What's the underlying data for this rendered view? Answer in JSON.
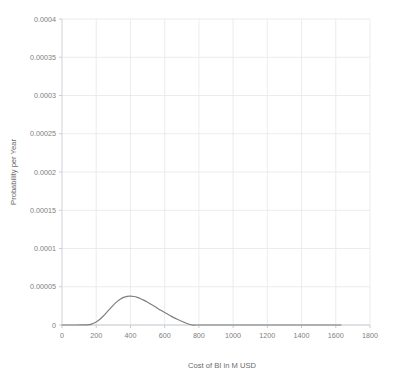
{
  "chart_data": {
    "type": "line",
    "title": "",
    "xlabel": "Cost of BI in M USD",
    "ylabel": "Probability per Year",
    "xlim": [
      0,
      1800
    ],
    "ylim": [
      0,
      0.0004
    ],
    "grid": true,
    "legend": false,
    "legend_position": "none",
    "line_color": "#7f7f7f",
    "xticks": [
      0,
      200,
      400,
      600,
      800,
      1000,
      1200,
      1400,
      1600,
      1800
    ],
    "xtick_labels": [
      "0",
      "200",
      "400",
      "600",
      "800",
      "1000",
      "1200",
      "1400",
      "1600",
      "1800"
    ],
    "yticks": [
      0,
      5e-05,
      0.0001,
      0.00015,
      0.0002,
      0.00025,
      0.0003,
      0.00035,
      0.0004
    ],
    "ytick_labels": [
      "0",
      "0.00005",
      "0.0001",
      "0.00015",
      "0.0002",
      "0.00025",
      "0.0003",
      "0.00035",
      "0.0004"
    ],
    "peak_x": 690,
    "peak_y": 3.77e-05,
    "series": [
      {
        "name": "Probability density of BI cost",
        "x": [
          0,
          40,
          80,
          120,
          160,
          180,
          200,
          220,
          240,
          260,
          280,
          300,
          320,
          340,
          360,
          380,
          400,
          420,
          440,
          460,
          480,
          500,
          520,
          540,
          560,
          580,
          600,
          620,
          640,
          660,
          680,
          700,
          720,
          740,
          760,
          780,
          800,
          820,
          840,
          860,
          880,
          900,
          920,
          940,
          960,
          980,
          1000,
          1040,
          1080,
          1120,
          1160,
          1200,
          1240,
          1280,
          1320,
          1360,
          1400,
          1440,
          1480,
          1520,
          1560,
          1600,
          1630
        ],
        "y": [
          0.0,
          0.0,
          0.0,
          0.0,
          2e-07,
          6e-07,
          1.6e-06,
          3.5e-06,
          6.8e-06,
          1.18e-05,
          1.86e-05,
          2.72e-05,
          3.75e-05,
          4.92e-05,
          6.19e-05,
          7.54e-05,
          8.91e-05,
          0.0001028,
          0.0001162,
          0.0001291,
          0.0001412,
          0.0001525,
          0.0001628,
          0.0001722,
          0.0001806,
          0.0001879,
          0.0001943,
          0.0001997,
          0.0002043,
          0.0002079,
          0.0002108,
          0.0002129,
          0.0002143,
          0.000215,
          0.0002152,
          0.0002148,
          0.000214,
          0.0002127,
          0.000211,
          0.000209,
          0.0002066,
          0.000204,
          0.0002011,
          0.000198,
          0.0001947,
          0.0001913,
          0.0001877,
          0.0001803,
          0.0001726,
          0.0001647,
          0.0001567,
          0.0001487,
          0.0001408,
          0.000133,
          0.0001254,
          0.0001179,
          0.0001107,
          0.0001037,
          9.69e-05,
          9.05e-05,
          8.43e-05,
          7.84e-05,
          7.51e-05
        ]
      }
    ]
  },
  "axis": {
    "x_title": "Cost of BI in M USD",
    "y_title": "Probability per Year"
  }
}
